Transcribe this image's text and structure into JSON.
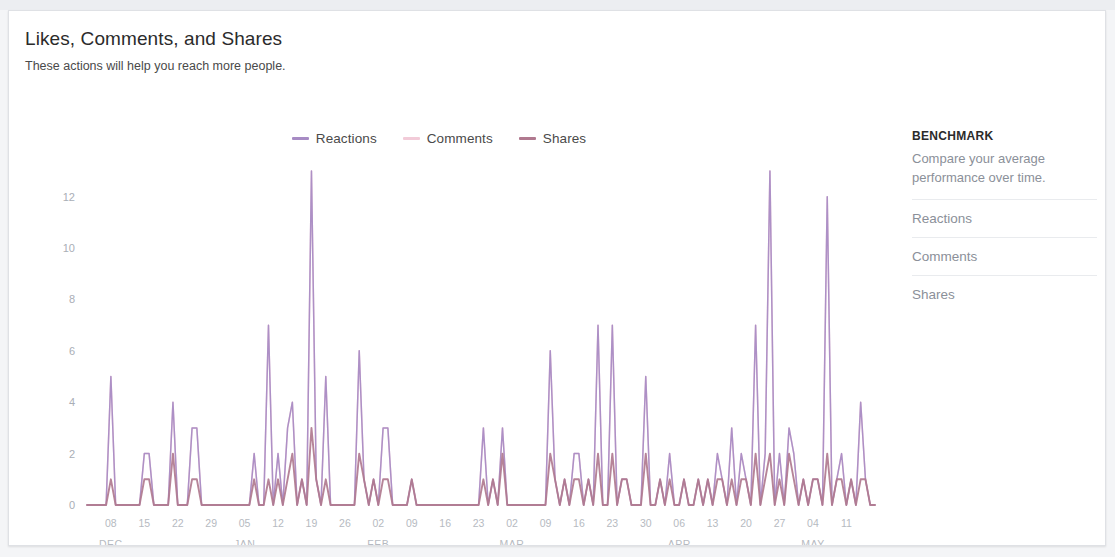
{
  "card": {
    "title": "Likes, Comments, and Shares",
    "subtitle": "These actions will help you reach more people."
  },
  "legend": [
    {
      "label": "Reactions",
      "color": "#a78bc4"
    },
    {
      "label": "Comments",
      "color": "#f2cbd8"
    },
    {
      "label": "Shares",
      "color": "#b0798f"
    }
  ],
  "benchmark": {
    "title": "BENCHMARK",
    "description": "Compare your average performance over time.",
    "items": [
      {
        "label": "Reactions"
      },
      {
        "label": "Comments"
      },
      {
        "label": "Shares"
      }
    ]
  },
  "chart_data": {
    "type": "line",
    "title": "Likes, Comments, and Shares",
    "subtitle": "These actions will help you reach more people.",
    "xlabel": "",
    "ylabel": "",
    "ylim": [
      0,
      13
    ],
    "yticks": [
      0,
      2,
      4,
      6,
      8,
      10,
      12
    ],
    "grid": false,
    "legend_position": "top-center",
    "x_tick_labels": [
      "08",
      "15",
      "22",
      "29",
      "05",
      "12",
      "19",
      "26",
      "02",
      "09",
      "16",
      "23",
      "02",
      "09",
      "16",
      "23",
      "30",
      "06",
      "13",
      "20",
      "27",
      "04",
      "11"
    ],
    "x_tick_indices": [
      5,
      12,
      19,
      26,
      33,
      40,
      47,
      54,
      61,
      68,
      75,
      82,
      89,
      96,
      103,
      110,
      117,
      124,
      131,
      138,
      145,
      152,
      159
    ],
    "month_labels": [
      {
        "label": "DEC",
        "index": 5
      },
      {
        "label": "JAN",
        "index": 33
      },
      {
        "label": "FEB",
        "index": 61
      },
      {
        "label": "MAR",
        "index": 89
      },
      {
        "label": "APR",
        "index": 124
      },
      {
        "label": "MAY",
        "index": 152
      }
    ],
    "n_points": 166,
    "series": [
      {
        "name": "Reactions",
        "color": "#a78bc4",
        "values": [
          0,
          0,
          0,
          5,
          0,
          0,
          0,
          2,
          2,
          0,
          0,
          4,
          0,
          3,
          3,
          0,
          0,
          0,
          0,
          0,
          0,
          2,
          0,
          7,
          2,
          3,
          4,
          1,
          13,
          1,
          5,
          0,
          0,
          0,
          6,
          1,
          1,
          3,
          3,
          0,
          0,
          1,
          0,
          0,
          0,
          0,
          0,
          0,
          0,
          0,
          3,
          1,
          3,
          0,
          0,
          0,
          0,
          0,
          6,
          1,
          1,
          2,
          2,
          1,
          7,
          0,
          7,
          1,
          1,
          0,
          5,
          0,
          1,
          2,
          0,
          1,
          0,
          1,
          1,
          2,
          1,
          3,
          2,
          1,
          7,
          2,
          13,
          2,
          3,
          2,
          1,
          1,
          1,
          12,
          1,
          2,
          1,
          4,
          1,
          0
        ]
      },
      {
        "name": "Comments",
        "color": "#f2cbd8",
        "values": [
          0,
          0,
          0,
          5,
          0,
          0,
          0,
          2,
          2,
          0,
          0,
          4,
          0,
          3,
          3,
          0,
          0,
          0,
          0,
          0,
          0,
          2,
          0,
          7,
          2,
          3,
          4,
          1,
          13,
          1,
          5,
          0,
          0,
          0,
          6,
          1,
          1,
          3,
          3,
          0,
          0,
          1,
          0,
          0,
          0,
          0,
          0,
          0,
          0,
          0,
          3,
          1,
          3,
          0,
          0,
          0,
          0,
          0,
          6,
          1,
          1,
          2,
          2,
          1,
          7,
          0,
          7,
          1,
          1,
          0,
          5,
          0,
          1,
          2,
          0,
          1,
          0,
          1,
          1,
          2,
          1,
          3,
          2,
          1,
          7,
          2,
          13,
          2,
          3,
          2,
          1,
          1,
          1,
          12,
          1,
          2,
          1,
          4,
          1,
          0
        ]
      },
      {
        "name": "Shares",
        "color": "#b0798f",
        "values": [
          0,
          0,
          0,
          1,
          0,
          0,
          0,
          1,
          1,
          0,
          0,
          2,
          0,
          1,
          1,
          0,
          0,
          0,
          0,
          0,
          0,
          1,
          0,
          1,
          1,
          1,
          2,
          1,
          3,
          1,
          1,
          0,
          0,
          0,
          2,
          1,
          1,
          1,
          1,
          0,
          0,
          1,
          0,
          0,
          0,
          0,
          0,
          0,
          0,
          0,
          1,
          1,
          2,
          0,
          0,
          0,
          0,
          0,
          2,
          1,
          1,
          1,
          1,
          1,
          2,
          0,
          2,
          1,
          1,
          0,
          2,
          0,
          1,
          1,
          0,
          1,
          0,
          1,
          1,
          1,
          1,
          1,
          1,
          1,
          2,
          1,
          2,
          1,
          2,
          1,
          1,
          1,
          1,
          2,
          1,
          1,
          1,
          1,
          1,
          0
        ]
      }
    ]
  }
}
